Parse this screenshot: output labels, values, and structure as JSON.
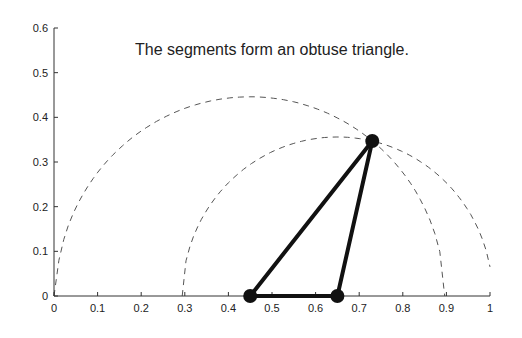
{
  "chart_data": {
    "type": "scatter",
    "title": "",
    "annotation": "The segments form an obtuse triangle.",
    "xlabel": "",
    "ylabel": "",
    "xlim": [
      0,
      1
    ],
    "ylim": [
      0,
      0.6
    ],
    "x_ticks": [
      "0",
      "0.1",
      "0.2",
      "0.3",
      "0.4",
      "0.5",
      "0.6",
      "0.7",
      "0.8",
      "0.9",
      "1"
    ],
    "y_ticks": [
      "0",
      "0.1",
      "0.2",
      "0.3",
      "0.4",
      "0.5",
      "0.6"
    ],
    "grid": false,
    "points": [
      {
        "x": 0.45,
        "y": 0
      },
      {
        "x": 0.65,
        "y": 0
      },
      {
        "x": 0.73,
        "y": 0.347
      }
    ],
    "segments": [
      {
        "from": [
          0.45,
          0
        ],
        "to": [
          0.65,
          0
        ]
      },
      {
        "from": [
          0.45,
          0
        ],
        "to": [
          0.73,
          0.347
        ]
      },
      {
        "from": [
          0.65,
          0
        ],
        "to": [
          0.73,
          0.347
        ]
      }
    ],
    "arcs": [
      {
        "style": "dashed",
        "center": [
          0.45,
          0
        ],
        "radius": 0.446,
        "x_range": [
          0.0,
          0.896
        ]
      },
      {
        "style": "dashed",
        "center": [
          0.65,
          0
        ],
        "radius": 0.356,
        "x_range": [
          0.294,
          1.0
        ]
      }
    ]
  }
}
